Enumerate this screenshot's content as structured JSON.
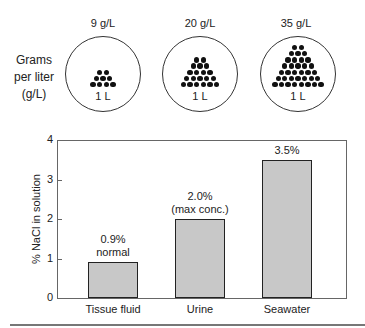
{
  "top_panel": {
    "side_label": [
      "Grams",
      "per liter",
      "(g/L)"
    ],
    "containers": [
      {
        "concentration": "9 g/L",
        "volume": "1 L",
        "dot_rows": [
          2,
          3,
          4
        ]
      },
      {
        "concentration": "20 g/L",
        "volume": "1 L",
        "dot_rows": [
          2,
          3,
          4,
          5,
          6
        ]
      },
      {
        "concentration": "35 g/L",
        "volume": "1 L",
        "dot_rows": [
          2,
          3,
          4,
          5,
          6,
          7,
          8
        ]
      }
    ]
  },
  "chart_data": {
    "type": "bar",
    "title": "",
    "categories": [
      "Tissue fluid",
      "Urine",
      "Seawater"
    ],
    "values": [
      0.9,
      2.0,
      3.5
    ],
    "bar_annotations": [
      [
        "0.9%",
        "normal"
      ],
      [
        "2.0%",
        "(max conc.)"
      ],
      [
        "3.5%"
      ]
    ],
    "xlabel": "",
    "ylabel": "% NaCl in solution",
    "ylim": [
      0,
      4
    ],
    "yticks": [
      "0",
      "1",
      "2",
      "3",
      "4"
    ],
    "grid": false,
    "bar_color": "#c8c8c8"
  }
}
